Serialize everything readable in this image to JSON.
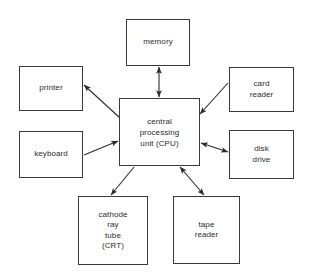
{
  "diagram": {
    "background_color": "#ffffff",
    "line_color": "#3a3a3a",
    "text_color": "#2b2b2b",
    "nodes": [
      {
        "id": "memory",
        "label": "memory",
        "x": 126,
        "y": 19,
        "w": 64,
        "h": 47
      },
      {
        "id": "printer",
        "label": "printer",
        "x": 19,
        "y": 66,
        "w": 64,
        "h": 45
      },
      {
        "id": "card-reader",
        "label": "card\nreader",
        "x": 229,
        "y": 67,
        "w": 65,
        "h": 45
      },
      {
        "id": "keyboard",
        "label": "keyboard",
        "x": 19,
        "y": 131,
        "w": 64,
        "h": 47
      },
      {
        "id": "cpu",
        "label": "central\nprocessing\nunit (CPU)",
        "x": 119,
        "y": 98,
        "w": 81,
        "h": 68
      },
      {
        "id": "disk-drive",
        "label": "disk\ndrive",
        "x": 229,
        "y": 130,
        "w": 65,
        "h": 49
      },
      {
        "id": "cathode-ray-tube",
        "label": "cathode\nray\ntube\n(CRT)",
        "x": 78,
        "y": 196,
        "w": 70,
        "h": 69
      },
      {
        "id": "tape-reader",
        "label": "tape\nreader",
        "x": 173,
        "y": 196,
        "w": 67,
        "h": 68
      }
    ],
    "connections": [
      {
        "id": "memory-cpu",
        "from": "memory",
        "to": "cpu",
        "direction": "bidirectional",
        "x1": 159,
        "y1": 67,
        "x2": 159,
        "y2": 97
      },
      {
        "id": "cpu-printer",
        "from": "cpu",
        "to": "printer",
        "direction": "to-node",
        "x1": 120,
        "y1": 118,
        "x2": 84,
        "y2": 85
      },
      {
        "id": "card-reader-cpu",
        "from": "card-reader",
        "to": "cpu",
        "direction": "to-cpu",
        "x1": 228,
        "y1": 83,
        "x2": 200,
        "y2": 114
      },
      {
        "id": "keyboard-cpu",
        "from": "keyboard",
        "to": "cpu",
        "direction": "to-cpu",
        "x1": 84,
        "y1": 155,
        "x2": 118,
        "y2": 141
      },
      {
        "id": "cpu-disk-drive",
        "from": "cpu",
        "to": "disk-drive",
        "direction": "bidirectional",
        "x1": 201,
        "y1": 143,
        "x2": 228,
        "y2": 152
      },
      {
        "id": "cpu-crt",
        "from": "cpu",
        "to": "cathode-ray-tube",
        "direction": "to-node",
        "x1": 134,
        "y1": 167,
        "x2": 111,
        "y2": 195
      },
      {
        "id": "cpu-tape-reader",
        "from": "cpu",
        "to": "tape-reader",
        "direction": "bidirectional",
        "x1": 180,
        "y1": 167,
        "x2": 204,
        "y2": 195
      }
    ]
  }
}
